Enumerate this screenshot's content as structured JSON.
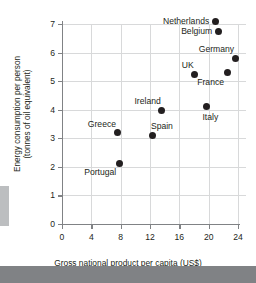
{
  "chart_data": {
    "type": "scatter",
    "title": "",
    "xlabel": "Gross national product per capita (US$)",
    "ylabel_line1": "Energy consumption per person",
    "ylabel_line2": "(tonnes of oil equivalent)",
    "xlim": [
      0,
      24
    ],
    "ylim": [
      0,
      7
    ],
    "xticks": [
      0,
      4,
      8,
      12,
      16,
      20,
      24
    ],
    "yticks": [
      0,
      1,
      2,
      3,
      4,
      5,
      6,
      7
    ],
    "xtick_labels": [
      "0",
      "4",
      "8",
      "12",
      "16",
      "20",
      "24"
    ],
    "ytick_labels": [
      "0",
      "1",
      "2",
      "3",
      "4",
      "5",
      "6",
      "7"
    ],
    "grid": true,
    "legend": "none",
    "marker_color": "#231f20",
    "grid_color": "#d8d9da",
    "axis_color": "#808285",
    "points": [
      {
        "label": "Netherlands",
        "x": 20.9,
        "y": 7.1,
        "label_pos": "left"
      },
      {
        "label": "Belgium",
        "x": 21.3,
        "y": 6.75,
        "label_pos": "left"
      },
      {
        "label": "Germany",
        "x": 23.6,
        "y": 5.8,
        "label_pos": "above-left"
      },
      {
        "label": "UK",
        "x": 18.1,
        "y": 5.25,
        "label_pos": "above-left"
      },
      {
        "label": "France",
        "x": 22.5,
        "y": 5.3,
        "label_pos": "below-left"
      },
      {
        "label": "Ireland",
        "x": 13.6,
        "y": 3.98,
        "label_pos": "above-left"
      },
      {
        "label": "Italy",
        "x": 19.7,
        "y": 4.1,
        "label_pos": "below-right"
      },
      {
        "label": "Greece",
        "x": 7.5,
        "y": 3.2,
        "label_pos": "above-left"
      },
      {
        "label": "Spain",
        "x": 12.4,
        "y": 3.1,
        "label_pos": "above-right"
      },
      {
        "label": "Portugal",
        "x": 7.8,
        "y": 2.13,
        "label_pos": "below-left"
      }
    ]
  }
}
